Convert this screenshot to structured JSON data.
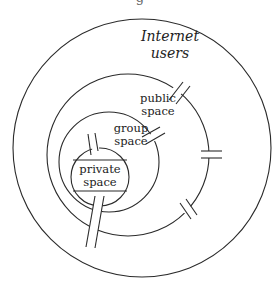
{
  "diagram": {
    "caption_fragment": "g",
    "rings": [
      {
        "id": "internet",
        "label_lines": [
          "Internet",
          "users"
        ],
        "italic": true
      },
      {
        "id": "public",
        "label_lines": [
          "public",
          "space"
        ]
      },
      {
        "id": "group",
        "label_lines": [
          "group",
          "space"
        ]
      },
      {
        "id": "private",
        "label_lines": [
          "private",
          "space"
        ]
      }
    ],
    "colors": {
      "stroke": "#2a2a2a",
      "background": "#ffffff",
      "text": "#222222"
    }
  }
}
